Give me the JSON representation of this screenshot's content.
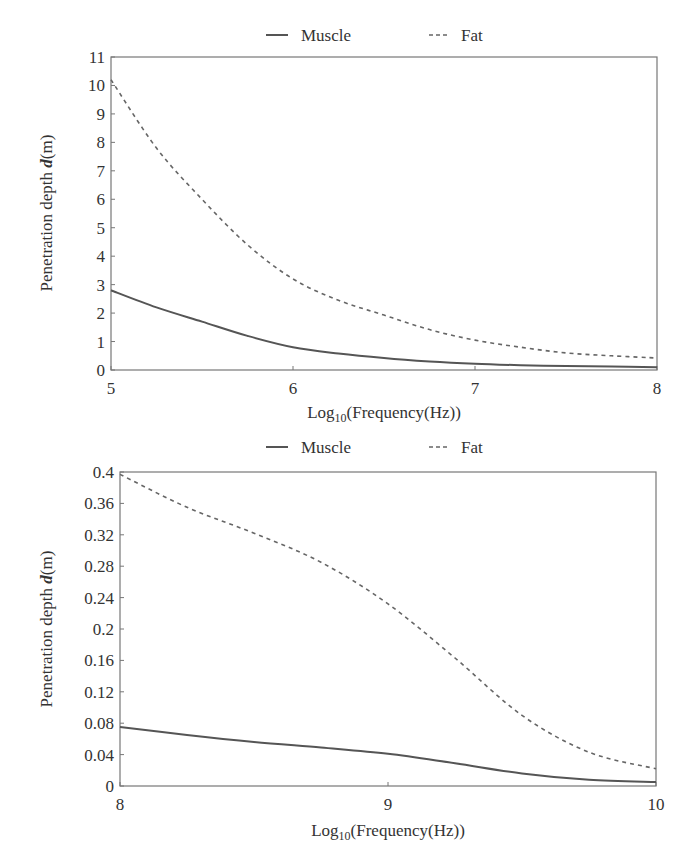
{
  "chart_data": [
    {
      "type": "line",
      "title": "",
      "xlabel": "Log10(Frequency(Hz))",
      "xlabel_parts": {
        "pre": "Log",
        "sub": "10",
        "post": "(Frequency(Hz))"
      },
      "ylabel": "Penetration depth d(m)",
      "ylabel_parts": {
        "pre": "Penetration depth ",
        "italic": "d",
        "post": "(m)"
      },
      "xlim": [
        5,
        8
      ],
      "ylim": [
        0,
        11
      ],
      "xticks": [
        "5",
        "6",
        "7",
        "8"
      ],
      "yticks": [
        "0",
        "1",
        "2",
        "3",
        "4",
        "5",
        "6",
        "7",
        "8",
        "9",
        "10",
        "11"
      ],
      "grid": false,
      "legend_position": "top-center",
      "legend": [
        "Muscle",
        "Fat"
      ],
      "x": [
        5.0,
        5.25,
        5.5,
        5.75,
        6.0,
        6.25,
        6.5,
        6.75,
        7.0,
        7.25,
        7.5,
        7.75,
        8.0
      ],
      "series": [
        {
          "name": "Muscle",
          "style": "solid",
          "values": [
            2.8,
            2.2,
            1.7,
            1.2,
            0.8,
            0.58,
            0.42,
            0.3,
            0.22,
            0.17,
            0.14,
            0.12,
            0.1
          ]
        },
        {
          "name": "Fat",
          "style": "dashed",
          "values": [
            10.2,
            7.8,
            6.0,
            4.4,
            3.2,
            2.45,
            1.93,
            1.42,
            1.05,
            0.8,
            0.6,
            0.5,
            0.42
          ]
        }
      ]
    },
    {
      "type": "line",
      "title": "",
      "xlabel": "Log10(Frequency(Hz))",
      "xlabel_parts": {
        "pre": "Log",
        "sub": "10",
        "post": "(Frequency(Hz))"
      },
      "ylabel": "Penetration depth d(m)",
      "ylabel_parts": {
        "pre": "Penetration depth ",
        "italic": "d",
        "post": "(m)"
      },
      "xlim": [
        8,
        10
      ],
      "ylim": [
        0,
        0.4
      ],
      "xticks": [
        "8",
        "9",
        "10"
      ],
      "yticks": [
        "0",
        "0.04",
        "0.08",
        "0.12",
        "0.16",
        "0.2",
        "0.24",
        "0.28",
        "0.32",
        "0.36",
        "0.4"
      ],
      "grid": false,
      "legend_position": "top-center",
      "legend": [
        "Muscle",
        "Fat"
      ],
      "x": [
        8.0,
        8.25,
        8.5,
        8.75,
        9.0,
        9.25,
        9.5,
        9.75,
        10.0
      ],
      "series": [
        {
          "name": "Muscle",
          "style": "solid",
          "values": [
            0.075,
            0.065,
            0.056,
            0.049,
            0.041,
            0.029,
            0.016,
            0.008,
            0.005
          ]
        },
        {
          "name": "Fat",
          "style": "dashed",
          "values": [
            0.397,
            0.355,
            0.322,
            0.285,
            0.232,
            0.163,
            0.09,
            0.043,
            0.022
          ]
        }
      ]
    }
  ],
  "colors": {
    "axis": "#555555",
    "muscle_line": "#555555",
    "fat_line": "#666666",
    "text": "#333333"
  }
}
